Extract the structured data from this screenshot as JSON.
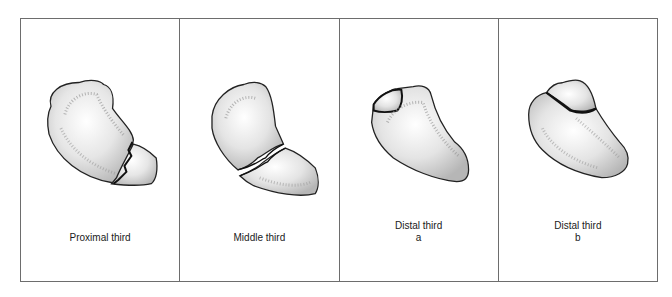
{
  "figure": {
    "panels": [
      {
        "id": "proximal",
        "caption": "Proximal third",
        "sub": ""
      },
      {
        "id": "middle",
        "caption": "Middle third",
        "sub": ""
      },
      {
        "id": "distal-a",
        "caption": "Distal third",
        "sub": "a"
      },
      {
        "id": "distal-b",
        "caption": "Distal third",
        "sub": "b"
      }
    ]
  }
}
